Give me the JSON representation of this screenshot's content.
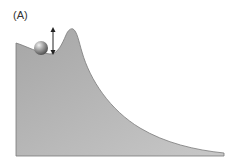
{
  "figure": {
    "label": "(A)",
    "colors": {
      "landscape_top": "#a9a9a9",
      "landscape_bottom": "#c4c4c4",
      "outline": "#7a7a7a",
      "ball": "#8a8a8a",
      "arrow": "#222222"
    }
  }
}
